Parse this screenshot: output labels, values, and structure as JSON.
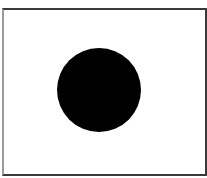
{
  "figure": {
    "frame": {
      "border_color": "#3a3a3a",
      "background": "#ffffff"
    },
    "shape": {
      "type": "circle",
      "fill": "#000000",
      "center": [
        99,
        90
      ],
      "diameter": 84
    }
  }
}
